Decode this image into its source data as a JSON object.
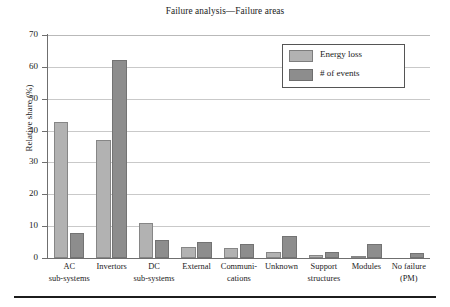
{
  "chart_data": {
    "type": "bar",
    "title": "Failure analysis—Failure areas",
    "xlabel": "",
    "ylabel": "Relative share (%)",
    "ylim": [
      0,
      70
    ],
    "yticks": [
      0,
      10,
      20,
      30,
      40,
      50,
      60,
      70
    ],
    "grid": true,
    "legend_position": "upper right",
    "categories": [
      "AC sub-systems",
      "Invertors",
      "DC sub-systems",
      "External",
      "Communi-cations",
      "Unknown",
      "Support structures",
      "Modules",
      "No failure (PM)"
    ],
    "category_lines": [
      [
        "AC",
        "sub-systems"
      ],
      [
        "Invertors",
        ""
      ],
      [
        "DC",
        "sub-systems"
      ],
      [
        "External",
        ""
      ],
      [
        "Communi-",
        "cations"
      ],
      [
        "Unknown",
        ""
      ],
      [
        "Support",
        "structures"
      ],
      [
        "Modules",
        ""
      ],
      [
        "No failure",
        "(PM)"
      ]
    ],
    "series": [
      {
        "name": "Energy loss",
        "color": "#b2b2b2",
        "values": [
          42.8,
          37.0,
          11.0,
          3.6,
          3.0,
          2.0,
          1.0,
          0.3,
          0.0
        ]
      },
      {
        "name": "# of events",
        "color": "#8d8d8d",
        "values": [
          8.0,
          62.2,
          5.8,
          4.9,
          4.3,
          6.9,
          1.9,
          4.4,
          1.6
        ]
      }
    ]
  },
  "legend": {
    "items": [
      {
        "label": "Energy loss",
        "swatch": "energy"
      },
      {
        "label": "# of events",
        "swatch": "events"
      }
    ]
  },
  "axis": {
    "y_title": "Relative share (%)",
    "y_tick_labels": [
      "0",
      "10",
      "20",
      "30",
      "40",
      "50",
      "60",
      "70"
    ]
  }
}
